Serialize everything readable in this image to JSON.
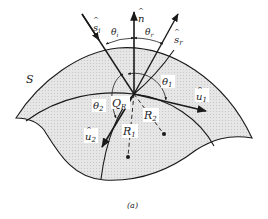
{
  "figure": {
    "caption": "(a)",
    "surface_label": "S",
    "point_label": "Q",
    "point_subscript": "R",
    "vectors": {
      "normal": {
        "hat": "^",
        "base": "n",
        "sub": ""
      },
      "incident": {
        "hat": "^",
        "base": "s",
        "sub": "i"
      },
      "reflected": {
        "hat": "^",
        "base": "s",
        "sub": "r"
      },
      "u1": {
        "hat": "^",
        "base": "u",
        "sub": "1"
      },
      "u2": {
        "hat": "^",
        "base": "u",
        "sub": "2"
      }
    },
    "angles": {
      "theta_i": {
        "base": "θ",
        "sub": "i"
      },
      "theta_r": {
        "base": "θ",
        "sub": "r"
      },
      "theta_1": {
        "base": "θ",
        "sub": "1"
      },
      "theta_2": {
        "base": "θ",
        "sub": "2"
      }
    },
    "radii": {
      "R1": {
        "base": "R",
        "sub": "1"
      },
      "R2": {
        "base": "R",
        "sub": "2"
      }
    },
    "colors": {
      "surface_fill": "#e4e4e4",
      "line": "#1a1a1a",
      "background": "#ffffff"
    }
  }
}
